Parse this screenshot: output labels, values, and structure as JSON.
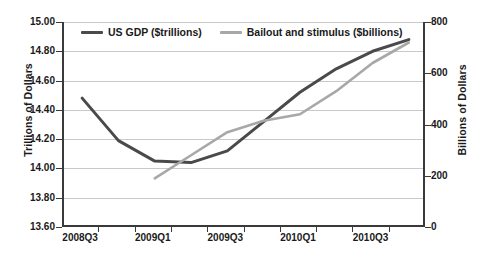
{
  "chart_data": {
    "type": "line",
    "title": "",
    "xlabel": "",
    "ylabel": "Trillions of Dollars",
    "y2label": "Billions of Dollars",
    "grid": true,
    "legend_position": "top-inside",
    "x": [
      "2008Q3",
      "2008Q4",
      "2009Q1",
      "2009Q2",
      "2009Q3",
      "2009Q4",
      "2010Q1",
      "2010Q2",
      "2010Q3",
      "2010Q4"
    ],
    "x_tick_labels": [
      "2008Q3",
      "2009Q1",
      "2009Q3",
      "2010Q1",
      "2010Q3"
    ],
    "ylim": [
      13.6,
      15.0
    ],
    "y_ticks": [
      13.6,
      13.8,
      14.0,
      14.2,
      14.4,
      14.6,
      14.8,
      15.0
    ],
    "y_tick_labels": [
      "13.60",
      "13.80",
      "14.00",
      "14.20",
      "14.40",
      "14.60",
      "14.80",
      "15.00"
    ],
    "y2lim": [
      0,
      800
    ],
    "y2_ticks": [
      0,
      200,
      400,
      600,
      800
    ],
    "y2_tick_labels": [
      "0",
      "200",
      "400",
      "600",
      "800"
    ],
    "y2_minor_ticks": [
      100,
      300,
      500,
      700
    ],
    "series": [
      {
        "name": "US GDP ($trillions)",
        "axis": "left",
        "color": "#4a4a4a",
        "units": "trillions",
        "values": [
          14.48,
          14.19,
          14.05,
          14.04,
          14.12,
          14.32,
          14.52,
          14.68,
          14.8,
          14.88
        ]
      },
      {
        "name": "Bailout and stimulus ($billions)",
        "axis": "right",
        "color": "#a8a8a8",
        "units": "billions",
        "values": [
          null,
          null,
          190,
          280,
          370,
          415,
          440,
          530,
          640,
          720
        ]
      }
    ]
  },
  "legend": {
    "entries": [
      {
        "label": "US GDP ($trillions)",
        "color": "#4a4a4a"
      },
      {
        "label": "Bailout and stimulus ($billions)",
        "color": "#a8a8a8"
      }
    ]
  },
  "axes": {
    "left_title": "Trillions of Dollars",
    "right_title": "Billions of Dollars"
  }
}
